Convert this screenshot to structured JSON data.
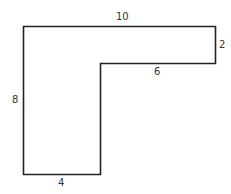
{
  "diagram": {
    "type": "L-shaped polygon",
    "stroke_color": "#222222",
    "labels": {
      "top": "10",
      "right": "2",
      "inner_horizontal": "6",
      "left": "8",
      "bottom": "4"
    }
  }
}
